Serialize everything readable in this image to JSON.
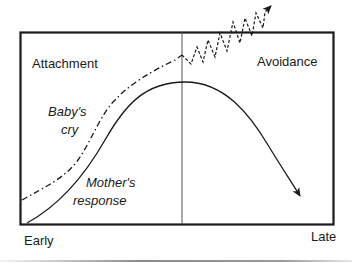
{
  "diagram": {
    "regions": {
      "left": "Attachment",
      "right": "Avoidance"
    },
    "curves": {
      "baby": {
        "label_line1": "Baby's",
        "label_line2": "cry",
        "style": "dash-dot"
      },
      "mother": {
        "label_line1": "Mother's",
        "label_line2": "response",
        "style": "solid"
      }
    },
    "axis": {
      "start": "Early",
      "end": "Late"
    },
    "colors": {
      "ink": "#1a1a1a",
      "divider": "#555555",
      "rule": "#8a8a8a"
    }
  }
}
